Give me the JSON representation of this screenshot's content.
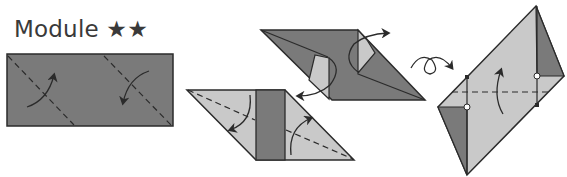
{
  "title": "Module ★★",
  "colors": {
    "dark_fill": "#7a7a7a",
    "light_fill": "#c9c9c9",
    "stroke": "#2b2b2b",
    "text": "#3a3a3a"
  },
  "steps": [
    {
      "id": 1,
      "description": "Rectangle with two diagonal valley-fold lines and fold arrows"
    },
    {
      "id": 2,
      "description": "Parallelogram with corners folded, arrows indicating unfold"
    },
    {
      "id": 3,
      "description": "Parallelogram with light triangular flaps, dark center strip, fold arrows"
    },
    {
      "id": 4,
      "description": "Turn over symbol, then tall parallelogram with horizontal dashed fold line and reference dots"
    }
  ]
}
